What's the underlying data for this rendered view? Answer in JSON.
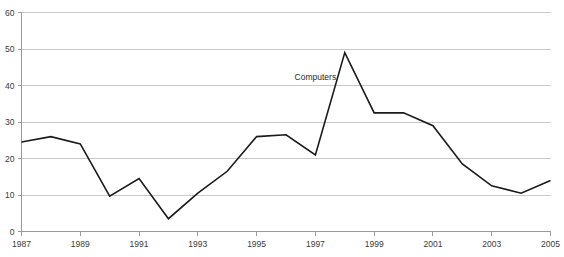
{
  "chart_data": {
    "type": "line",
    "title": "",
    "subtitle": "",
    "xlabel": "",
    "ylabel": "",
    "grid": true,
    "legend_position": "inline-annotation",
    "xlim": [
      1987,
      2005
    ],
    "ylim": [
      0,
      60
    ],
    "y_ticks": [
      0,
      10,
      20,
      30,
      40,
      50,
      60
    ],
    "y_tick_labels": [
      "0",
      "10",
      "20",
      "30",
      "40",
      "50",
      "60"
    ],
    "x_ticks": [
      1987,
      1989,
      1991,
      1993,
      1995,
      1997,
      1999,
      2001,
      2003,
      2005
    ],
    "x_tick_labels": [
      "1987",
      "1989",
      "1991",
      "1993",
      "1995",
      "1997",
      "1999",
      "2001",
      "2003",
      "2005"
    ],
    "x": [
      1987,
      1988,
      1989,
      1990,
      1991,
      1992,
      1993,
      1994,
      1995,
      1996,
      1997,
      1998,
      1999,
      2000,
      2001,
      2002,
      2003,
      2004,
      2005
    ],
    "series": [
      {
        "name": "Computers",
        "values": [
          24.5,
          26.0,
          24.0,
          9.7,
          14.5,
          3.5,
          10.5,
          16.5,
          26.0,
          26.5,
          21.0,
          49.0,
          32.5,
          32.5,
          29.0,
          18.5,
          12.5,
          10.5,
          14.0
        ],
        "color": "#1a1a1a"
      }
    ],
    "annotations": [
      {
        "text": "Computers",
        "x": 1997.0,
        "y": 41.5
      }
    ]
  },
  "style": {
    "background_color": "#ffffff",
    "grid_color": "#c9c9c9",
    "axis_color": "#9a9a9a",
    "text_color": "#3a3a3a",
    "line_color": "#1a1a1a"
  }
}
